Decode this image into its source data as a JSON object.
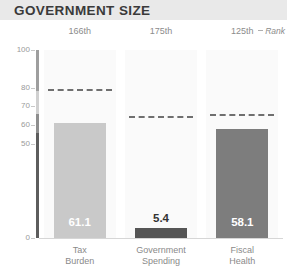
{
  "header": {
    "title": "GOVERNMENT SIZE"
  },
  "rank_legend": {
    "label": "Rank"
  },
  "chart_data": {
    "type": "bar",
    "title": "GOVERNMENT SIZE",
    "xlabel": "",
    "ylabel": "",
    "ylim": [
      0,
      100
    ],
    "grid": false,
    "legend_position": "right",
    "categories": [
      "Tax Burden",
      "Government Spending",
      "Fiscal Health"
    ],
    "category_lines": [
      [
        "Tax",
        "Burden"
      ],
      [
        "Government",
        "Spending"
      ],
      [
        "Fiscal",
        "Health"
      ]
    ],
    "values": [
      61.1,
      5.4,
      58.1
    ],
    "value_labels": [
      "61.1",
      "5.4",
      "58.1"
    ],
    "ranks": [
      "166th",
      "175th",
      "125th"
    ],
    "reference_values": [
      79,
      65,
      66
    ],
    "reference_label": "World average",
    "bar_colors": [
      "#c9c9c9",
      "#555555",
      "#7d7d7d"
    ],
    "value_label_colors": [
      "#ffffff",
      "#333333",
      "#ffffff"
    ],
    "ytick_values": [
      100,
      80,
      70,
      60,
      50,
      0
    ],
    "ytick_labels": [
      "100",
      "80",
      "70",
      "60",
      "50",
      "0"
    ]
  },
  "colors": {
    "header_band": "#e9e9e9",
    "column_band": "#fafafa",
    "dashed_line": "#6f6f6f",
    "axis_tick": "#c8c8c8",
    "text_muted": "#8c8c8c"
  }
}
